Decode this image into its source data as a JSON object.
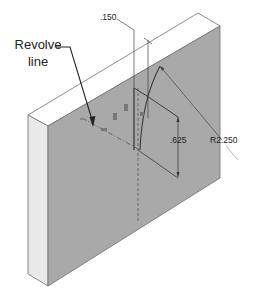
{
  "figure": {
    "callout_label_line1": "Revolve",
    "callout_label_line2": "line",
    "dimensions": {
      "offset": ".150",
      "height": ".625",
      "radius": "R2.250"
    },
    "colors": {
      "front_face": "#a9a9a9",
      "side_face": "#e9e9e9",
      "top_face": "#ffffff",
      "edge": "#6e6e6e",
      "sketch": "#3a3a3a"
    }
  }
}
